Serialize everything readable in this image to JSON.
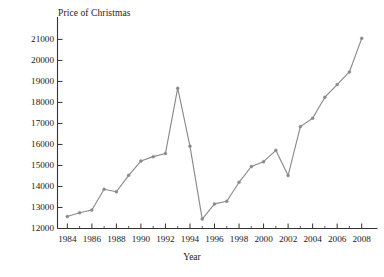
{
  "chart_data": {
    "type": "line",
    "title": "Price of Christmas",
    "xlabel": "Year",
    "ylabel": "",
    "xlim": [
      1983.2,
      2008.8
    ],
    "ylim": [
      12000,
      21400
    ],
    "grid": false,
    "legend": "none",
    "line_color": "#8a8a8a",
    "marker_color": "#8a8a8a",
    "axis_color": "#333333",
    "x": [
      1984,
      1985,
      1986,
      1987,
      1988,
      1989,
      1990,
      1991,
      1992,
      1993,
      1994,
      1995,
      1996,
      1997,
      1998,
      1999,
      2000,
      2001,
      2002,
      2003,
      2004,
      2005,
      2006,
      2007,
      2008
    ],
    "values": [
      12570,
      12750,
      12880,
      13870,
      13750,
      14530,
      15210,
      15420,
      15570,
      18680,
      15920,
      12450,
      13170,
      13300,
      14200,
      14950,
      15180,
      15720,
      14520,
      16850,
      17250,
      18250,
      18850,
      19450,
      21050
    ],
    "xticks": [
      1984,
      1986,
      1988,
      1990,
      1992,
      1994,
      1996,
      1998,
      2000,
      2002,
      2004,
      2006,
      2008
    ],
    "xtick_labels": [
      "1984",
      "1986",
      "1988",
      "1990",
      "1992",
      "1994",
      "1996",
      "1998",
      "2000",
      "2002",
      "2004",
      "2006",
      "2008"
    ],
    "yticks": [
      12000,
      13000,
      14000,
      15000,
      16000,
      17000,
      18000,
      19000,
      20000,
      21000
    ],
    "ytick_labels": [
      "12000",
      "13000",
      "14000",
      "15000",
      "16000",
      "17000",
      "18000",
      "19000",
      "20000",
      "21000"
    ]
  }
}
